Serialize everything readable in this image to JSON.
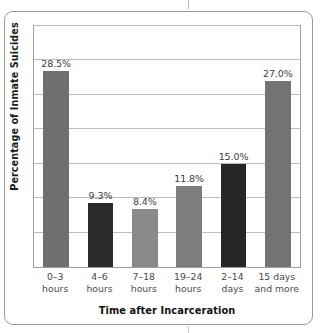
{
  "figure": {
    "background": "#ffffff",
    "frame_color": "#9a9a9a",
    "plot_border_color": "#9f9f9f",
    "gridline_color": "#bdbdbd"
  },
  "chart_data": {
    "type": "bar",
    "title": "",
    "xlabel": "Time after Incarceration",
    "ylabel": "Percentage of Inmate Suicides",
    "categories": [
      "0–3 hours",
      "4–6 hours",
      "7–18 hours",
      "19–24 hours",
      "2–14 days",
      "15 days and more"
    ],
    "category_lines": [
      {
        "line1": "0–3",
        "line2": "hours"
      },
      {
        "line1": "4–6",
        "line2": "hours"
      },
      {
        "line1": "7–18",
        "line2": "hours"
      },
      {
        "line1": "19–24",
        "line2": "hours"
      },
      {
        "line1": "2–14",
        "line2": "days"
      },
      {
        "line1": "15 days",
        "line2": "and more"
      }
    ],
    "values": [
      28.5,
      9.3,
      8.4,
      11.8,
      15.0,
      27.0
    ],
    "value_labels": [
      "28.5%",
      "9.3%",
      "8.4%",
      "11.8%",
      "15.0%",
      "27.0%"
    ],
    "bar_colors": [
      "#6f6f6f",
      "#2b2b2b",
      "#8a8a8a",
      "#7d7d7d",
      "#262626",
      "#737373"
    ],
    "ylim": [
      0,
      35
    ],
    "y_gridline_values": [
      5,
      10,
      15,
      20,
      25,
      30,
      35
    ],
    "y_tick_labels_shown": false,
    "grid": true,
    "legend": "none",
    "bar_width_pct": 58
  }
}
